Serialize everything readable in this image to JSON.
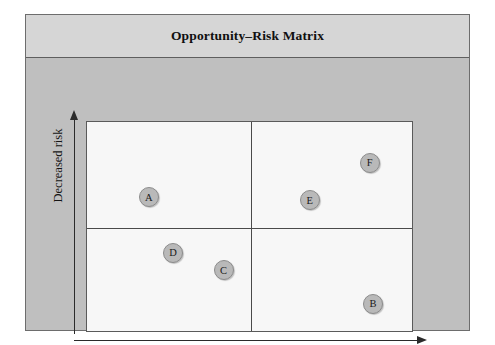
{
  "figure": {
    "title": "Opportunity–Risk Matrix"
  },
  "axes": {
    "y_label": "Decreased risk",
    "x_label": "Increased opportunity"
  },
  "colors": {
    "frame_fill": "#bfbfbf",
    "title_band_fill": "#d6d6d6",
    "plot_fill": "#f7f7f7",
    "bubble_fill": "#b9b9b9",
    "bubble_stroke": "#8c8c8c",
    "axis_stroke": "#2b2b2b",
    "divider_stroke": "#4a4a4a"
  },
  "chart_data": {
    "type": "scatter",
    "title": "Opportunity–Risk Matrix",
    "xlabel": "Increased opportunity",
    "ylabel": "Decreased risk",
    "xlim": [
      0,
      100
    ],
    "ylim": [
      0,
      100
    ],
    "grid": false,
    "legend": null,
    "quadrant_dividers": {
      "x": 50.4,
      "y": 49.3
    },
    "points": [
      {
        "label": "A",
        "x": 19.0,
        "y": 64.0
      },
      {
        "label": "B",
        "x": 88.0,
        "y": 13.0
      },
      {
        "label": "C",
        "x": 42.0,
        "y": 29.0
      },
      {
        "label": "D",
        "x": 26.5,
        "y": 37.5
      },
      {
        "label": "E",
        "x": 68.5,
        "y": 62.5
      },
      {
        "label": "F",
        "x": 87.0,
        "y": 80.5
      }
    ]
  }
}
